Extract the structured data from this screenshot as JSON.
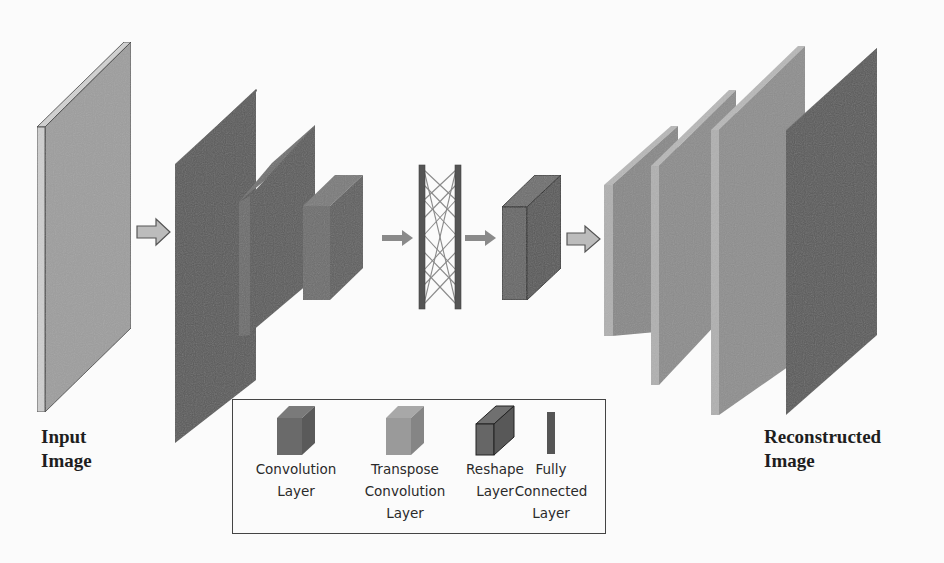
{
  "figure": {
    "input_label_line1": "Input",
    "input_label_line2": "Image",
    "output_label_line1": "Reconstructed",
    "output_label_line2": "Image"
  },
  "colors": {
    "background": "#fbfbfb",
    "input_plate": "#9e9e9e",
    "input_edge": "#cfcfcf",
    "conv_layer": "#5e5e5e",
    "conv_layer_side": "#6d6d6d",
    "transpose_conv_layer": "#8c8c8c",
    "transpose_edge": "#b4b4b4",
    "reshape_layer": "#606060",
    "fully_connected": "#555555",
    "output_plate": "#5a5a5a",
    "arrow_fill": "#bcbcbc",
    "arrow_stroke": "#555555"
  },
  "pipeline": [
    {
      "id": "input",
      "type": "input_image"
    },
    {
      "id": "conv1",
      "type": "convolution"
    },
    {
      "id": "conv2",
      "type": "convolution"
    },
    {
      "id": "conv3",
      "type": "convolution"
    },
    {
      "id": "fc",
      "type": "fully_connected"
    },
    {
      "id": "reshape",
      "type": "reshape"
    },
    {
      "id": "tconv1",
      "type": "transpose_convolution"
    },
    {
      "id": "tconv2",
      "type": "transpose_convolution"
    },
    {
      "id": "tconv3",
      "type": "transpose_convolution"
    },
    {
      "id": "output",
      "type": "reconstructed_image"
    }
  ],
  "legend": {
    "items": [
      {
        "label_line1": "Convolution",
        "label_line2": "Layer",
        "label_line3": ""
      },
      {
        "label_line1": "Transpose",
        "label_line2": "Convolution",
        "label_line3": "Layer"
      },
      {
        "label_line1": "Reshape",
        "label_line2": "Layer",
        "label_line3": ""
      },
      {
        "label_line1": "Fully",
        "label_line2": "Connected Layer",
        "label_line3": ""
      }
    ]
  }
}
